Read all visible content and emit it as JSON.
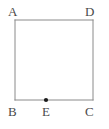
{
  "figure": {
    "background_color": "#ffffff",
    "stroke_color": "#8a8a8a",
    "label_color": "#4a4a4a",
    "point_color": "#1a1a1a",
    "shape": {
      "type": "square",
      "stroke_width": 1,
      "fill": "none",
      "corners": {
        "top_left": {
          "x": 15,
          "y": 20
        },
        "top_right": {
          "x": 93,
          "y": 20
        },
        "bottom_right": {
          "x": 93,
          "y": 100
        },
        "bottom_left": {
          "x": 15,
          "y": 100
        }
      },
      "width": 78,
      "height": 80
    },
    "points": [
      {
        "name": "E",
        "x": 46,
        "y": 100,
        "radius": 2,
        "on_segment": "BC"
      }
    ],
    "labels": [
      {
        "name": "A",
        "text": "A",
        "x": 8,
        "y": 5,
        "vertex": "top_left"
      },
      {
        "name": "D",
        "text": "D",
        "x": 85,
        "y": 5,
        "vertex": "top_right"
      },
      {
        "name": "B",
        "text": "B",
        "x": 8,
        "y": 105,
        "vertex": "bottom_left"
      },
      {
        "name": "E",
        "text": "E",
        "x": 42,
        "y": 105,
        "vertex": "point_on_bottom_edge"
      },
      {
        "name": "C",
        "text": "C",
        "x": 85,
        "y": 105,
        "vertex": "bottom_right"
      }
    ]
  }
}
